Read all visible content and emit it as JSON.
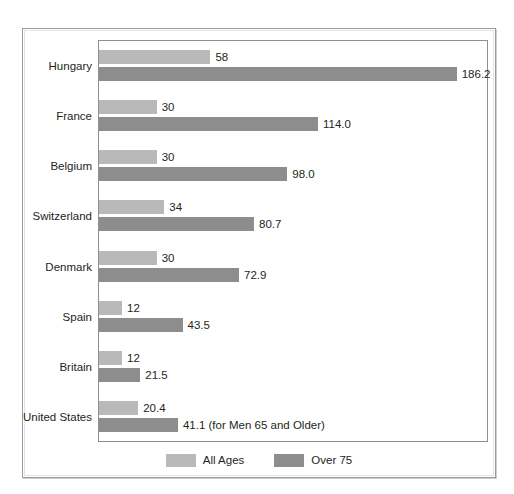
{
  "chart_data": {
    "type": "bar",
    "orientation": "horizontal",
    "title": "",
    "subtitle": "",
    "xlabel": "",
    "ylabel": "",
    "grid": false,
    "legend_position": "bottom-center",
    "xlim": [
      0,
      203
    ],
    "categories": [
      "Hungary",
      "France",
      "Belgium",
      "Switzerland",
      "Denmark",
      "Spain",
      "Britain",
      "United States"
    ],
    "series": [
      {
        "name": "All Ages",
        "color": "#b9b9b9",
        "values": [
          58,
          30,
          30,
          34,
          30,
          12,
          12,
          20.4
        ],
        "labels": [
          "58",
          "30",
          "30",
          "34",
          "30",
          "12",
          "12",
          "20.4"
        ]
      },
      {
        "name": "Over 75",
        "color": "#8d8d8d",
        "values": [
          186.2,
          114.0,
          98.0,
          80.7,
          72.9,
          43.5,
          21.5,
          41.1
        ],
        "labels": [
          "186.2",
          "114.0",
          "98.0",
          "80.7",
          "72.9",
          "43.5",
          "21.5",
          "41.1 (for Men 65 and Older)"
        ]
      }
    ]
  },
  "legend": {
    "items": [
      {
        "label": "All Ages",
        "color": "#b9b9b9"
      },
      {
        "label": "Over 75",
        "color": "#8d8d8d"
      }
    ]
  },
  "colors": {
    "all_ages": "#b9b9b9",
    "over_75": "#8d8d8d",
    "text": "#231f20",
    "frame": "#9a9a9a",
    "plot_border": "#8f8f8f",
    "background": "#ffffff"
  }
}
